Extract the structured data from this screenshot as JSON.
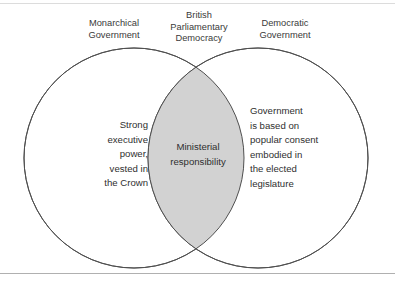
{
  "figure": {
    "type": "venn-diagram-two-set",
    "frame": {
      "top_rule": true,
      "bottom_rule": true
    },
    "colors": {
      "circle_stroke": "#4f4f4f",
      "overlap_fill": "#d2d2d2",
      "lobe_fill": "#ffffff",
      "text": "#2f2f2f",
      "header_text": "#3a3a3a",
      "frame_rule": "#b0b0b0",
      "page_background": "#ffffff"
    },
    "headers": {
      "left": "Monarchical\nGovernment",
      "center": "British\nParliamentary\nDemocracy",
      "right": "Democratic\nGovernment"
    },
    "sets": {
      "left": {
        "name": "Monarchical Government",
        "body": "Strong\nexecutive\npower,\nvested in\nthe Crown"
      },
      "right": {
        "name": "Democratic Government",
        "body": "Government\nis based on\npopular consent\nembodied in\nthe elected\nlegislature"
      },
      "intersection": {
        "name": "British Parliamentary Democracy",
        "body": "Ministerial\nresponsibility"
      }
    },
    "geometry": {
      "left_circle": {
        "cx": 134,
        "cy": 158,
        "r": 110
      },
      "right_circle": {
        "cx": 258,
        "cy": 158,
        "r": 110
      }
    }
  }
}
